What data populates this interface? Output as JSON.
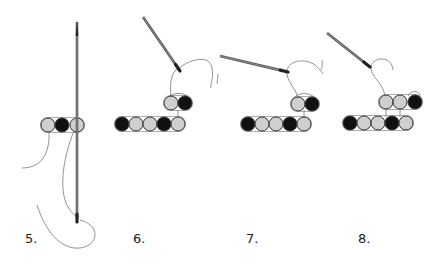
{
  "diagram": {
    "type": "beading-steps",
    "colors": {
      "dark_bead": "#111111",
      "light_bead": "#cfcfcf",
      "bead_outline": "#333333",
      "thread": "#666666",
      "needle": "#555555",
      "needle_dark": "#222222",
      "label": "#222222"
    },
    "steps": [
      {
        "id": "step-5",
        "label": "5.",
        "label_pos": [
          25,
          232
        ],
        "beads": [
          {
            "x": 48,
            "y": 125,
            "color": "light"
          },
          {
            "x": 62,
            "y": 125,
            "color": "dark"
          },
          {
            "x": 77,
            "y": 125,
            "color": "light"
          }
        ],
        "needle": {
          "x1": 77,
          "y1": 22,
          "x2": 77,
          "y2": 222,
          "orientation": "vertical"
        }
      },
      {
        "id": "step-6",
        "label": "6.",
        "label_pos": [
          133,
          232
        ],
        "beads": [
          {
            "x": 122,
            "y": 124,
            "color": "dark"
          },
          {
            "x": 136,
            "y": 124,
            "color": "light"
          },
          {
            "x": 150,
            "y": 124,
            "color": "light"
          },
          {
            "x": 164,
            "y": 124,
            "color": "dark"
          },
          {
            "x": 178,
            "y": 124,
            "color": "light"
          },
          {
            "x": 171,
            "y": 103,
            "color": "light"
          },
          {
            "x": 185,
            "y": 103,
            "color": "dark"
          }
        ],
        "needle": {
          "x1": 143,
          "y1": 17,
          "x2": 180,
          "y2": 71
        }
      },
      {
        "id": "step-7",
        "label": "7.",
        "label_pos": [
          246,
          232
        ],
        "beads": [
          {
            "x": 248,
            "y": 124,
            "color": "dark"
          },
          {
            "x": 262,
            "y": 124,
            "color": "light"
          },
          {
            "x": 276,
            "y": 124,
            "color": "light"
          },
          {
            "x": 290,
            "y": 124,
            "color": "dark"
          },
          {
            "x": 304,
            "y": 124,
            "color": "light"
          },
          {
            "x": 298,
            "y": 104,
            "color": "light"
          },
          {
            "x": 312,
            "y": 104,
            "color": "dark"
          }
        ],
        "needle": {
          "x1": 220,
          "y1": 56,
          "x2": 288,
          "y2": 72
        }
      },
      {
        "id": "step-8",
        "label": "8.",
        "label_pos": [
          358,
          232
        ],
        "beads": [
          {
            "x": 350,
            "y": 123,
            "color": "dark"
          },
          {
            "x": 364,
            "y": 123,
            "color": "light"
          },
          {
            "x": 378,
            "y": 123,
            "color": "light"
          },
          {
            "x": 392,
            "y": 123,
            "color": "dark"
          },
          {
            "x": 406,
            "y": 123,
            "color": "light"
          },
          {
            "x": 386,
            "y": 102,
            "color": "light"
          },
          {
            "x": 400,
            "y": 102,
            "color": "light"
          },
          {
            "x": 415,
            "y": 102,
            "color": "dark"
          }
        ],
        "needle": {
          "x1": 327,
          "y1": 33,
          "x2": 370,
          "y2": 67
        }
      }
    ]
  }
}
